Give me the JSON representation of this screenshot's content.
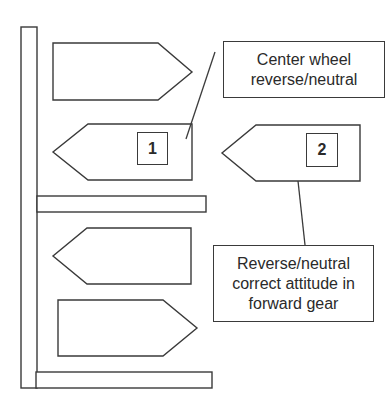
{
  "diagram": {
    "type": "parking-pen-arrow-diagram",
    "colors": {
      "stroke": "#3a3a3a",
      "fill": "#ffffff",
      "text": "#2a2a2a"
    },
    "markers": [
      {
        "id": "1",
        "label": "1"
      },
      {
        "id": "2",
        "label": "2"
      }
    ],
    "callouts": [
      {
        "id": "center-wheel",
        "lines": [
          "Center wheel",
          "reverse/neutral"
        ]
      },
      {
        "id": "correct-attitude",
        "lines": [
          "Reverse/neutral",
          "correct attitude in",
          "forward gear"
        ]
      }
    ],
    "arrows": [
      {
        "id": "arrow-1",
        "direction": "right"
      },
      {
        "id": "arrow-2",
        "direction": "left",
        "marker": "1"
      },
      {
        "id": "arrow-3",
        "direction": "left",
        "marker": "2"
      },
      {
        "id": "arrow-4",
        "direction": "left"
      },
      {
        "id": "arrow-5",
        "direction": "right"
      }
    ]
  }
}
